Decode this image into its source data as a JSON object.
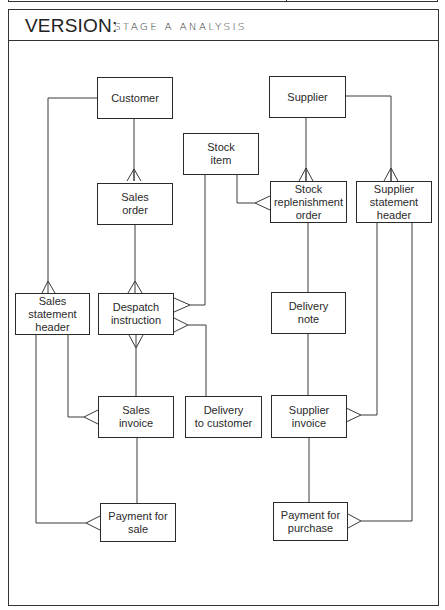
{
  "header": {
    "version_label": "VERSION:",
    "version_value": "STAGE A ANALYSIS"
  },
  "entities": {
    "customer": "Customer",
    "supplier": "Supplier",
    "stock_item": "Stock\nitem",
    "sales_order": "Sales\norder",
    "stock_replenishment_order": "Stock\nreplenishment\norder",
    "supplier_statement_header": "Supplier\nstatement\nheader",
    "sales_statement_header": "Sales\nstatement\nheader",
    "despatch_instruction": "Despatch\ninstruction",
    "delivery_note": "Delivery\nnote",
    "sales_invoice": "Sales\ninvoice",
    "delivery_to_customer": "Delivery\nto customer",
    "supplier_invoice": "Supplier\ninvoice",
    "payment_for_sale": "Payment for\nsale",
    "payment_for_purchase": "Payment for\npurchase"
  },
  "relationships": [
    {
      "from": "Customer",
      "to": "Sales order",
      "type": "one-to-many"
    },
    {
      "from": "Customer",
      "to": "Sales statement header",
      "type": "one-to-many"
    },
    {
      "from": "Sales order",
      "to": "Despatch instruction",
      "type": "one-to-many"
    },
    {
      "from": "Stock item",
      "to": "Stock replenishment order",
      "type": "one-to-many"
    },
    {
      "from": "Stock item",
      "to": "Despatch instruction",
      "type": "one-to-many"
    },
    {
      "from": "Delivery to customer",
      "to": "Despatch instruction",
      "type": "one-to-many"
    },
    {
      "from": "Sales invoice",
      "to": "Despatch instruction",
      "type": "one-to-many"
    },
    {
      "from": "Sales statement header",
      "to": "Sales invoice",
      "type": "one-to-many"
    },
    {
      "from": "Sales statement header",
      "to": "Payment for sale",
      "type": "one-to-many"
    },
    {
      "from": "Sales invoice",
      "to": "Payment for sale",
      "type": "one-to-one"
    },
    {
      "from": "Supplier",
      "to": "Stock replenishment order",
      "type": "one-to-many"
    },
    {
      "from": "Supplier",
      "to": "Supplier statement header",
      "type": "one-to-many"
    },
    {
      "from": "Stock replenishment order",
      "to": "Delivery note",
      "type": "one-to-one"
    },
    {
      "from": "Delivery note",
      "to": "Supplier invoice",
      "type": "one-to-one"
    },
    {
      "from": "Supplier statement header",
      "to": "Supplier invoice",
      "type": "one-to-many"
    },
    {
      "from": "Supplier statement header",
      "to": "Payment for purchase",
      "type": "one-to-many"
    },
    {
      "from": "Supplier invoice",
      "to": "Payment for purchase",
      "type": "one-to-one"
    }
  ]
}
